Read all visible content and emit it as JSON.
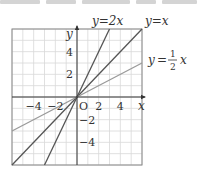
{
  "top_text_cropped": true,
  "chart_data": {
    "type": "line",
    "title": "",
    "xlabel": "x",
    "ylabel": "y",
    "origin_label": "O",
    "xlim": [
      -6,
      6
    ],
    "ylim": [
      -6,
      6
    ],
    "grid": true,
    "grid_step": 1,
    "x_ticks": [
      -4,
      -2,
      2,
      4
    ],
    "y_ticks": [
      4,
      2,
      -2,
      -4
    ],
    "x_tick_labels": [
      "−4",
      "−2",
      "2",
      "4"
    ],
    "y_tick_labels": [
      "4",
      "2",
      "−2",
      "−4"
    ],
    "series": [
      {
        "name": "y=2x",
        "slope": 2,
        "x": [
          -3,
          3
        ],
        "y": [
          -6,
          6
        ],
        "color": "#555555",
        "label_var": "y",
        "label_rhs": "2x"
      },
      {
        "name": "y=x",
        "slope": 1,
        "x": [
          -6,
          6
        ],
        "y": [
          -6,
          6
        ],
        "color": "#555555",
        "label_var": "y",
        "label_rhs": "x"
      },
      {
        "name": "y=1/2x",
        "slope": 0.5,
        "x": [
          -6,
          6
        ],
        "y": [
          -3,
          3
        ],
        "color": "#9a9a9a",
        "label_var": "y",
        "label_num": "1",
        "label_den": "2",
        "label_rhs": "x"
      }
    ],
    "colors": {
      "grid": "#d8d8d8",
      "border": "#888888",
      "axis": "#333333"
    }
  }
}
